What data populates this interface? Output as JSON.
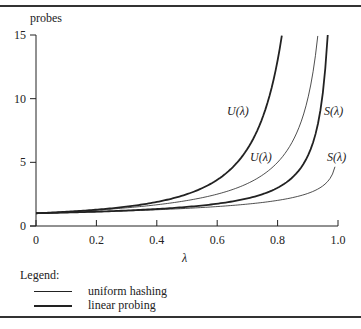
{
  "chart_data": {
    "type": "line",
    "title": "",
    "xlabel": "λ",
    "ylabel": "probes",
    "xlim": [
      0,
      1.0
    ],
    "ylim": [
      0,
      15
    ],
    "xticks": [
      "0",
      "0.2",
      "0.4",
      "0.6",
      "0.8",
      "1.0"
    ],
    "yticks": [
      "0",
      "5",
      "10",
      "15"
    ],
    "grid": false,
    "legend_position": "bottom-left",
    "legend": {
      "title": "Legend:",
      "entries": [
        {
          "label": "uniform hashing",
          "style": "thin"
        },
        {
          "label": "linear probing",
          "style": "thick"
        }
      ]
    },
    "series": [
      {
        "name": "U(λ) uniform hashing",
        "style": "thin",
        "formula": "1/(1-λ)",
        "x": [
          0,
          0.2,
          0.4,
          0.6,
          0.8,
          0.9,
          0.933
        ],
        "values": [
          1,
          1.25,
          1.67,
          2.5,
          5,
          10,
          15
        ]
      },
      {
        "name": "S(λ) uniform hashing",
        "style": "thin",
        "formula": "(1/λ)ln(1/(1-λ))",
        "x": [
          0,
          0.2,
          0.4,
          0.6,
          0.8,
          0.9,
          0.95,
          0.99
        ],
        "values": [
          1,
          1.12,
          1.28,
          1.53,
          2.01,
          2.56,
          3.15,
          4.65
        ]
      },
      {
        "name": "U(λ) linear probing",
        "style": "thick",
        "formula": "½(1+1/(1-λ)²)",
        "x": [
          0,
          0.2,
          0.4,
          0.6,
          0.7,
          0.8,
          0.814
        ],
        "values": [
          1,
          1.28,
          1.89,
          3.63,
          6.06,
          13,
          15
        ]
      },
      {
        "name": "S(λ) linear probing",
        "style": "thick",
        "formula": "½(1+1/(1-λ))",
        "x": [
          0,
          0.2,
          0.4,
          0.6,
          0.8,
          0.9,
          0.966
        ],
        "values": [
          1,
          1.13,
          1.33,
          1.75,
          3,
          5.5,
          15
        ]
      }
    ],
    "annotations": [
      {
        "text": "U(λ)",
        "near_series": "U(λ) linear probing",
        "pos": [
          0.6,
          7.5
        ]
      },
      {
        "text": "U(λ)",
        "near_series": "U(λ) uniform hashing",
        "pos": [
          0.76,
          5.0
        ]
      },
      {
        "text": "S(λ)",
        "near_series": "S(λ) linear probing",
        "pos": [
          0.93,
          7.5
        ]
      },
      {
        "text": "S(λ)",
        "near_series": "S(λ) uniform hashing",
        "pos": [
          0.98,
          5.0
        ]
      }
    ]
  },
  "labels": {
    "ylabel": "probes",
    "xlabel": "λ",
    "yticks": [
      "15",
      "10",
      "5",
      "0"
    ],
    "xticks": [
      "0",
      "0.2",
      "0.4",
      "0.6",
      "0.8",
      "1.0"
    ],
    "curve_labels": [
      "U(λ)",
      "U(λ)",
      "S(λ)",
      "S(λ)"
    ],
    "legend_title": "Legend:",
    "legend_items": [
      "uniform hashing",
      "linear probing"
    ]
  }
}
